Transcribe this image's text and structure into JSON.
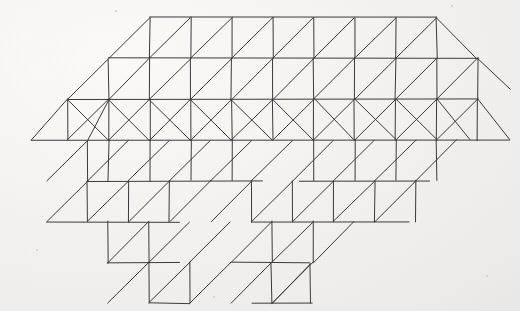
{
  "document": {
    "title": "Triangulated mesh figure",
    "kind": "line-drawing",
    "medium": "ink on paper",
    "background_color": "#f2f1ee",
    "ink_color": "#3a3a3c",
    "width": 520,
    "height": 311
  },
  "figure": {
    "name": "triangulated-animal-mesh",
    "stroke_width": 1,
    "grid": {
      "cell_width": 41,
      "cell_height": 40.8,
      "shear_per_row": 20.5,
      "origin_x": 150,
      "origin_y": 18,
      "row_y": [
        18,
        58.8,
        99.6,
        140.4,
        181.2,
        222,
        262.8,
        303.6
      ]
    },
    "geometry": {
      "comment": "All drawn segments as [x1,y1,x2,y2] in pixel coordinates of the 520x311 canvas",
      "segments": [
        [
          150,
          18,
          437,
          18
        ],
        [
          109,
          58.8,
          478,
          58.8
        ],
        [
          68,
          99.6,
          478,
          99.6
        ],
        [
          32,
          140.4,
          510,
          140.4
        ],
        [
          88,
          181.2,
          263,
          181.2
        ],
        [
          300,
          181.2,
          430,
          181.2
        ],
        [
          47,
          222,
          180,
          222
        ],
        [
          252,
          222,
          410,
          222
        ],
        [
          108,
          262.8,
          180,
          262.8
        ],
        [
          232,
          262.8,
          310,
          262.8
        ],
        [
          150,
          303.6,
          190,
          303.6
        ],
        [
          252,
          303.6,
          312,
          303.6
        ],
        [
          150,
          18,
          109,
          58.8
        ],
        [
          191,
          18,
          150,
          58.8
        ],
        [
          232,
          18,
          191,
          58.8
        ],
        [
          273,
          18,
          232,
          58.8
        ],
        [
          314,
          18,
          273,
          58.8
        ],
        [
          355,
          18,
          314,
          58.8
        ],
        [
          396,
          18,
          355,
          58.8
        ],
        [
          437,
          18,
          396,
          58.8
        ],
        [
          437,
          18,
          478,
          58.8
        ],
        [
          109,
          58.8,
          68,
          99.6
        ],
        [
          150,
          58.8,
          109,
          99.6
        ],
        [
          191,
          58.8,
          150,
          99.6
        ],
        [
          232,
          58.8,
          191,
          99.6
        ],
        [
          273,
          58.8,
          232,
          99.6
        ],
        [
          314,
          58.8,
          273,
          99.6
        ],
        [
          355,
          58.8,
          314,
          99.6
        ],
        [
          396,
          58.8,
          355,
          99.6
        ],
        [
          437,
          58.8,
          396,
          99.6
        ],
        [
          478,
          58.8,
          437,
          99.6
        ],
        [
          478,
          58.8,
          510,
          90
        ],
        [
          68,
          99.6,
          32,
          140.4
        ],
        [
          109,
          99.6,
          68,
          140.4
        ],
        [
          150,
          99.6,
          109,
          140.4
        ],
        [
          191,
          99.6,
          150,
          140.4
        ],
        [
          232,
          99.6,
          191,
          140.4
        ],
        [
          273,
          99.6,
          232,
          140.4
        ],
        [
          314,
          99.6,
          273,
          140.4
        ],
        [
          355,
          99.6,
          314,
          140.4
        ],
        [
          396,
          99.6,
          355,
          140.4
        ],
        [
          437,
          99.6,
          396,
          140.4
        ],
        [
          478,
          99.6,
          437,
          140.4
        ],
        [
          478,
          99.6,
          510,
          140.4
        ],
        [
          437,
          99.6,
          470,
          140.4
        ],
        [
          88,
          140.4,
          47,
          181.2
        ],
        [
          129,
          140.4,
          88,
          181.2
        ],
        [
          170,
          140.4,
          129,
          181.2
        ],
        [
          211,
          140.4,
          170,
          181.2
        ],
        [
          252,
          140.4,
          211,
          181.2
        ],
        [
          293,
          140.4,
          252,
          181.2
        ],
        [
          334,
          140.4,
          293,
          181.2
        ],
        [
          375,
          140.4,
          334,
          181.2
        ],
        [
          416,
          140.4,
          375,
          181.2
        ],
        [
          457,
          140.4,
          416,
          181.2
        ],
        [
          88,
          181.2,
          47,
          222
        ],
        [
          129,
          181.2,
          88,
          222
        ],
        [
          170,
          181.2,
          129,
          222
        ],
        [
          211,
          181.2,
          170,
          222
        ],
        [
          252,
          181.2,
          211,
          222
        ],
        [
          293,
          181.2,
          252,
          222
        ],
        [
          334,
          181.2,
          293,
          222
        ],
        [
          375,
          181.2,
          334,
          222
        ],
        [
          416,
          181.2,
          375,
          222
        ],
        [
          149,
          222,
          108,
          262.8
        ],
        [
          190,
          222,
          149,
          262.8
        ],
        [
          231,
          222,
          190,
          262.8
        ],
        [
          272,
          222,
          231,
          262.8
        ],
        [
          313,
          222,
          272,
          262.8
        ],
        [
          354,
          222,
          313,
          262.8
        ],
        [
          149,
          262.8,
          108,
          303.6
        ],
        [
          190,
          262.8,
          149,
          303.6
        ],
        [
          231,
          262.8,
          190,
          303.6
        ],
        [
          272,
          262.8,
          231,
          303.6
        ],
        [
          313,
          262.8,
          272,
          303.6
        ],
        [
          109,
          58.8,
          150,
          18
        ],
        [
          150,
          58.8,
          191,
          18
        ],
        [
          191,
          58.8,
          232,
          18
        ],
        [
          232,
          58.8,
          273,
          18
        ],
        [
          273,
          58.8,
          314,
          18
        ],
        [
          314,
          58.8,
          355,
          18
        ],
        [
          355,
          58.8,
          396,
          18
        ],
        [
          396,
          58.8,
          437,
          18
        ],
        [
          150,
          18,
          150,
          58.8
        ],
        [
          191,
          18,
          191,
          58.8
        ],
        [
          232,
          18,
          232,
          58.8
        ],
        [
          273,
          18,
          273,
          58.8
        ],
        [
          314,
          18,
          314,
          58.8
        ],
        [
          355,
          18,
          355,
          58.8
        ],
        [
          396,
          18,
          396,
          58.8
        ],
        [
          437,
          18,
          437,
          58.8
        ],
        [
          109,
          58.8,
          109,
          99.6
        ],
        [
          150,
          58.8,
          150,
          99.6
        ],
        [
          191,
          58.8,
          191,
          99.6
        ],
        [
          232,
          58.8,
          232,
          99.6
        ],
        [
          273,
          58.8,
          273,
          99.6
        ],
        [
          314,
          58.8,
          314,
          99.6
        ],
        [
          355,
          58.8,
          355,
          99.6
        ],
        [
          396,
          58.8,
          396,
          99.6
        ],
        [
          437,
          58.8,
          437,
          99.6
        ],
        [
          478,
          58.8,
          478,
          99.6
        ],
        [
          68,
          99.6,
          68,
          140.4
        ],
        [
          109,
          99.6,
          109,
          140.4
        ],
        [
          150,
          99.6,
          150,
          140.4
        ],
        [
          191,
          99.6,
          191,
          140.4
        ],
        [
          232,
          99.6,
          232,
          140.4
        ],
        [
          273,
          99.6,
          273,
          140.4
        ],
        [
          314,
          99.6,
          314,
          140.4
        ],
        [
          355,
          99.6,
          355,
          140.4
        ],
        [
          396,
          99.6,
          396,
          140.4
        ],
        [
          437,
          99.6,
          437,
          140.4
        ],
        [
          478,
          99.6,
          478,
          140.4
        ],
        [
          88,
          140.4,
          88,
          181.2
        ],
        [
          109,
          140.4,
          109,
          181.2
        ],
        [
          150,
          140.4,
          150,
          181.2
        ],
        [
          191,
          140.4,
          191,
          181.2
        ],
        [
          232,
          140.4,
          232,
          181.2
        ],
        [
          314,
          140.4,
          314,
          181.2
        ],
        [
          355,
          140.4,
          355,
          181.2
        ],
        [
          396,
          140.4,
          396,
          181.2
        ],
        [
          437,
          140.4,
          437,
          181.2
        ],
        [
          88,
          181.2,
          88,
          222
        ],
        [
          129,
          181.2,
          129,
          222
        ],
        [
          170,
          181.2,
          170,
          222
        ],
        [
          252,
          181.2,
          252,
          222
        ],
        [
          293,
          181.2,
          293,
          222
        ],
        [
          334,
          181.2,
          334,
          222
        ],
        [
          375,
          181.2,
          375,
          222
        ],
        [
          416,
          181.2,
          416,
          222
        ],
        [
          108,
          222,
          108,
          262.8
        ],
        [
          149,
          222,
          149,
          262.8
        ],
        [
          272,
          222,
          272,
          262.8
        ],
        [
          313,
          222,
          313,
          262.8
        ],
        [
          149,
          262.8,
          149,
          303.6
        ],
        [
          190,
          262.8,
          190,
          303.6
        ],
        [
          272,
          262.8,
          272,
          303.6
        ],
        [
          311,
          262.8,
          311,
          303.6
        ],
        [
          109,
          99.6,
          150,
          140.4
        ],
        [
          68,
          99.6,
          109,
          140.4
        ],
        [
          150,
          99.6,
          191,
          140.4
        ],
        [
          191,
          99.6,
          232,
          140.4
        ],
        [
          232,
          99.6,
          273,
          140.4
        ],
        [
          273,
          99.6,
          314,
          140.4
        ],
        [
          314,
          99.6,
          355,
          140.4
        ],
        [
          355,
          99.6,
          396,
          140.4
        ],
        [
          396,
          99.6,
          437,
          140.4
        ],
        [
          68,
          99.6,
          32,
          140.4
        ],
        [
          88,
          140.4,
          109,
          99.6
        ],
        [
          88,
          181.2,
          129,
          140.4
        ],
        [
          129,
          181.2,
          170,
          140.4
        ],
        [
          170,
          181.2,
          211,
          140.4
        ],
        [
          211,
          181.2,
          252,
          140.4
        ],
        [
          252,
          181.2,
          293,
          140.4
        ],
        [
          293,
          181.2,
          334,
          140.4
        ],
        [
          334,
          181.2,
          375,
          140.4
        ],
        [
          375,
          181.2,
          416,
          140.4
        ],
        [
          416,
          181.2,
          457,
          140.4
        ],
        [
          47,
          222,
          88,
          181.2
        ],
        [
          88,
          222,
          129,
          181.2
        ],
        [
          129,
          222,
          170,
          181.2
        ],
        [
          170,
          222,
          211,
          181.2
        ],
        [
          252,
          222,
          293,
          181.2
        ],
        [
          293,
          222,
          334,
          181.2
        ],
        [
          334,
          222,
          375,
          181.2
        ],
        [
          375,
          222,
          416,
          181.2
        ],
        [
          108,
          262.8,
          149,
          222
        ],
        [
          149,
          262.8,
          190,
          222
        ],
        [
          231,
          262.8,
          272,
          222
        ],
        [
          272,
          262.8,
          313,
          222
        ],
        [
          108,
          303.6,
          149,
          262.8
        ],
        [
          149,
          303.6,
          190,
          262.8
        ],
        [
          231,
          303.6,
          272,
          262.8
        ],
        [
          272,
          303.6,
          311,
          264
        ]
      ]
    }
  },
  "speckles": [
    {
      "x": 452,
      "y": 6,
      "r": 1.4
    },
    {
      "x": 116,
      "y": 11,
      "r": 1.1
    },
    {
      "x": 37,
      "y": 250,
      "r": 1.0
    },
    {
      "x": 487,
      "y": 276,
      "r": 1.2
    },
    {
      "x": 214,
      "y": 297,
      "r": 1.0
    }
  ]
}
